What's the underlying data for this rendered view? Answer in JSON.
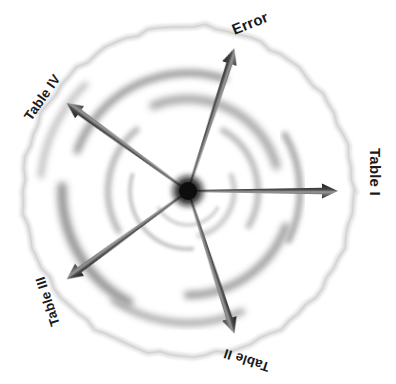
{
  "figure": {
    "type": "radial-spoke-diagram",
    "title_cut_off": "",
    "background_color": "#ffffff",
    "center": {
      "x": 188,
      "y": 191
    },
    "outer_circle": {
      "name": "outer-boundary-circle",
      "radius": 165,
      "color": "#d9d9d9",
      "stroke_width": 4,
      "style": "soft blurred sketchy ring"
    },
    "hub": {
      "name": "center-hub",
      "radius": 11,
      "color": "#0d0d0d"
    },
    "axes": [
      {
        "id": "table-1",
        "label": "Table I",
        "angle_deg": 0,
        "length": 150,
        "label_rotation_deg": 90,
        "label_x": 370,
        "label_y": 172,
        "arrow_color_dark": "#1a1a1a",
        "arrow_color_light": "#9a9a9a"
      },
      {
        "id": "table-2",
        "label": "Table II",
        "angle_deg": 72,
        "length": 150,
        "label_rotation_deg": 198,
        "label_x": 248,
        "label_y": 356,
        "arrow_color_dark": "#1a1a1a",
        "arrow_color_light": "#9a9a9a"
      },
      {
        "id": "table-3",
        "label": "Table III",
        "angle_deg": 144,
        "length": 150,
        "label_rotation_deg": 252,
        "label_x": 52,
        "label_y": 300,
        "arrow_color_dark": "#1a1a1a",
        "arrow_color_light": "#9a9a9a"
      },
      {
        "id": "table-4",
        "label": "Table IV",
        "angle_deg": 216,
        "length": 150,
        "label_rotation_deg": -55,
        "label_x": 46,
        "label_y": 100,
        "arrow_color_dark": "#1a1a1a",
        "arrow_color_light": "#9a9a9a"
      },
      {
        "id": "error",
        "label": "Error",
        "angle_deg": 288,
        "length": 150,
        "label_rotation_deg": -22,
        "label_x": 252,
        "label_y": 28,
        "arrow_color_dark": "#1a1a1a",
        "arrow_color_light": "#9a9a9a"
      }
    ],
    "spiral_arcs": [
      {
        "id": "arc-1",
        "radius": 118,
        "start_deg": 200,
        "sweep_deg": 88,
        "color": "#8f8f8f",
        "width": 7,
        "blur": 3.2
      },
      {
        "id": "arc-2",
        "radius": 92,
        "start_deg": 248,
        "sweep_deg": 96,
        "color": "#9c9c9c",
        "width": 8,
        "blur": 3.5
      },
      {
        "id": "arc-3",
        "radius": 70,
        "start_deg": 300,
        "sweep_deg": 90,
        "color": "#b4b4b4",
        "width": 6,
        "blur": 2.6
      },
      {
        "id": "arc-4",
        "radius": 46,
        "start_deg": 340,
        "sweep_deg": 96,
        "color": "#c2c2c2",
        "width": 5,
        "blur": 2.0
      },
      {
        "id": "arc-5",
        "radius": 126,
        "start_deg": 118,
        "sweep_deg": 64,
        "color": "#878787",
        "width": 9,
        "blur": 3.8
      },
      {
        "id": "arc-6",
        "radius": 104,
        "start_deg": 20,
        "sweep_deg": 70,
        "color": "#9a9a9a",
        "width": 8,
        "blur": 3.4
      },
      {
        "id": "arc-7",
        "radius": 132,
        "start_deg": 66,
        "sweep_deg": 58,
        "color": "#a6a6a6",
        "width": 7,
        "blur": 3.0
      },
      {
        "id": "arc-8",
        "radius": 80,
        "start_deg": 150,
        "sweep_deg": 80,
        "color": "#b0b0b0",
        "width": 6,
        "blur": 2.4
      },
      {
        "id": "arc-9",
        "radius": 58,
        "start_deg": 86,
        "sweep_deg": 110,
        "color": "#c8c8c8",
        "width": 4.5,
        "blur": 1.8
      },
      {
        "id": "arc-10",
        "radius": 148,
        "start_deg": 186,
        "sweep_deg": 40,
        "color": "#b8b8b8",
        "width": 6,
        "blur": 3.0
      },
      {
        "id": "arc-11",
        "radius": 34,
        "start_deg": 30,
        "sweep_deg": 120,
        "color": "#d2d2d2",
        "width": 4,
        "blur": 1.5
      },
      {
        "id": "arc-12",
        "radius": 112,
        "start_deg": 330,
        "sweep_deg": 56,
        "color": "#a8a8a8",
        "width": 7,
        "blur": 2.8
      }
    ]
  }
}
